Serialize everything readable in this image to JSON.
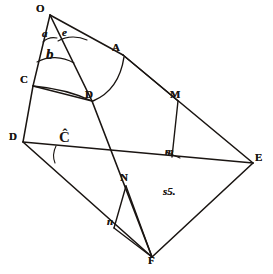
{
  "figure": {
    "caption": "s5.",
    "background_color": "#ffffff",
    "ink_color": "#1a1512",
    "width": 273,
    "height": 274
  },
  "points": [
    {
      "id": "O",
      "label": "O",
      "x": 50,
      "y": 15,
      "label_x": 36,
      "label_y": 3,
      "kind": "vertex"
    },
    {
      "id": "A",
      "label": "A",
      "x": 123,
      "y": 55,
      "label_x": 112,
      "label_y": 42,
      "kind": "vertex"
    },
    {
      "id": "C",
      "label": "C",
      "x": 33,
      "y": 86,
      "label_x": 20,
      "label_y": 74,
      "kind": "vertex"
    },
    {
      "id": "D2",
      "label": "D",
      "x": 92,
      "y": 101,
      "label_x": 85,
      "label_y": 89,
      "kind": "vertex"
    },
    {
      "id": "M",
      "label": "M",
      "x": 178,
      "y": 101,
      "label_x": 170,
      "label_y": 89,
      "kind": "vertex"
    },
    {
      "id": "D",
      "label": "D",
      "x": 23,
      "y": 142,
      "label_x": 9,
      "label_y": 131,
      "kind": "vertex"
    },
    {
      "id": "m",
      "label": "m",
      "x": 172,
      "y": 155,
      "label_x": 165,
      "label_y": 149,
      "kind": "minor"
    },
    {
      "id": "E",
      "label": "E",
      "x": 253,
      "y": 163,
      "label_x": 255,
      "label_y": 152,
      "kind": "vertex"
    },
    {
      "id": "N",
      "label": "N",
      "x": 126,
      "y": 186,
      "label_x": 120,
      "label_y": 172,
      "kind": "vertex"
    },
    {
      "id": "n",
      "label": "n",
      "x": 114,
      "y": 227,
      "label_x": 108,
      "label_y": 218,
      "kind": "minor"
    },
    {
      "id": "F",
      "label": "F",
      "x": 152,
      "y": 257,
      "label_x": 148,
      "label_y": 254,
      "kind": "vertex"
    }
  ],
  "angle_labels": [
    {
      "id": "a",
      "label": "a",
      "x": 44,
      "y": 31,
      "note": "angle at O left"
    },
    {
      "id": "e",
      "label": "e",
      "x": 63,
      "y": 31,
      "note": "angle at O right"
    },
    {
      "id": "b",
      "label": "b",
      "x": 47,
      "y": 52,
      "note": "angle at O lower"
    },
    {
      "id": "C-hat",
      "label": "Ĉ",
      "x": 61,
      "y": 138,
      "note": "angle at D marked C with caret"
    }
  ],
  "segments": [
    {
      "from": "O",
      "to": "A",
      "name": "O-A"
    },
    {
      "from": "A",
      "to": "E",
      "name": "A-E"
    },
    {
      "from": "O",
      "to": "C",
      "name": "O-C"
    },
    {
      "from": "C",
      "to": "D",
      "name": "C-D"
    },
    {
      "from": "O",
      "to": "D2",
      "name": "O-D2"
    },
    {
      "from": "D2",
      "to": "F",
      "name": "D2-F"
    },
    {
      "from": "C",
      "to": "D2",
      "name": "C-D2"
    },
    {
      "from": "D",
      "to": "E",
      "name": "D-E"
    },
    {
      "from": "D",
      "to": "F",
      "name": "D-F"
    },
    {
      "from": "F",
      "to": "E",
      "name": "F-E"
    },
    {
      "from": "A",
      "to": "M",
      "name": "A-M"
    },
    {
      "from": "M",
      "to": "m",
      "name": "M-m"
    },
    {
      "from": "N",
      "to": "n",
      "name": "N-n"
    },
    {
      "from": "N",
      "to": "F",
      "name": "N-F"
    },
    {
      "from": "n",
      "to": "F",
      "name": "n-F"
    }
  ],
  "arcs": [
    {
      "id": "arc-AD",
      "from": "A",
      "to": "D2",
      "name": "arc-A-to-D"
    },
    {
      "id": "arc-C-D2",
      "from": "C",
      "to": "D2",
      "name": "arc-C-to-D"
    },
    {
      "id": "arc-a",
      "name": "angle-arc-a"
    },
    {
      "id": "arc-e",
      "name": "angle-arc-e"
    },
    {
      "id": "arc-b",
      "name": "angle-arc-b"
    },
    {
      "id": "arc-Chat",
      "name": "angle-arc-C-hat"
    }
  ]
}
